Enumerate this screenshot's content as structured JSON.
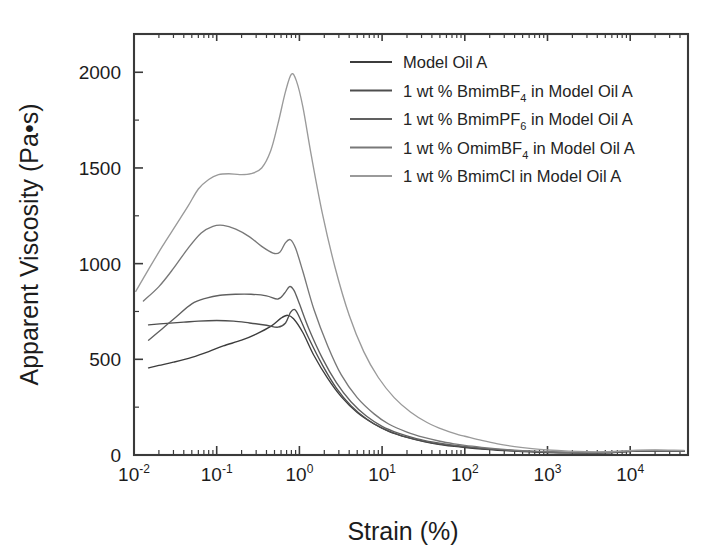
{
  "chart_data": {
    "type": "line",
    "title": "",
    "xlabel": "Strain (%)",
    "ylabel": "Apparent Viscosity (Pa•s)",
    "xscale": "log",
    "yscale": "linear",
    "xlim": [
      0.01,
      50000
    ],
    "ylim": [
      0,
      2200
    ],
    "grid": false,
    "legend_position": "top-right",
    "xticks": [
      {
        "value": 0.01,
        "mantissa": "10",
        "exponent": "-2",
        "label": "10-2"
      },
      {
        "value": 0.1,
        "mantissa": "10",
        "exponent": "-1",
        "label": "10-1"
      },
      {
        "value": 1,
        "mantissa": "10",
        "exponent": "0",
        "label": "100"
      },
      {
        "value": 10,
        "mantissa": "10",
        "exponent": "1",
        "label": "101"
      },
      {
        "value": 100,
        "mantissa": "10",
        "exponent": "2",
        "label": "102"
      },
      {
        "value": 1000,
        "mantissa": "10",
        "exponent": "3",
        "label": "103"
      },
      {
        "value": 10000,
        "mantissa": "10",
        "exponent": "4",
        "label": "104"
      }
    ],
    "yticks": [
      {
        "value": 0,
        "label": "0"
      },
      {
        "value": 500,
        "label": "500"
      },
      {
        "value": 1000,
        "label": "1000"
      },
      {
        "value": 1500,
        "label": "1500"
      },
      {
        "value": 2000,
        "label": "2000"
      }
    ],
    "yticks_minor": [
      250,
      750,
      1250,
      1750
    ],
    "series": [
      {
        "name": "Model Oil A",
        "label": "Model Oil A",
        "color": "#3c3c3c",
        "points": [
          [
            0.015,
            455
          ],
          [
            0.02,
            468
          ],
          [
            0.03,
            485
          ],
          [
            0.05,
            510
          ],
          [
            0.08,
            540
          ],
          [
            0.12,
            570
          ],
          [
            0.2,
            600
          ],
          [
            0.3,
            632
          ],
          [
            0.45,
            672
          ],
          [
            0.6,
            715
          ],
          [
            0.72,
            730
          ],
          [
            0.85,
            712
          ],
          [
            1.1,
            640
          ],
          [
            1.5,
            520
          ],
          [
            2.2,
            400
          ],
          [
            3.2,
            305
          ],
          [
            5,
            222
          ],
          [
            8,
            162
          ],
          [
            12,
            124
          ],
          [
            20,
            92
          ],
          [
            32,
            70
          ],
          [
            50,
            55
          ],
          [
            75,
            45
          ],
          [
            100,
            39
          ],
          [
            160,
            31
          ],
          [
            250,
            25
          ],
          [
            400,
            20
          ],
          [
            650,
            16
          ],
          [
            1000,
            13
          ],
          [
            1800,
            11
          ],
          [
            3000,
            10
          ],
          [
            5000,
            11
          ],
          [
            8000,
            16
          ],
          [
            12000,
            20
          ],
          [
            20000,
            21
          ],
          [
            32000,
            20
          ],
          [
            45000,
            19
          ]
        ]
      },
      {
        "name": "1 wt % BmimBF4 in Model Oil A",
        "label_parts": {
          "pre": "1 wt % BmimBF",
          "sub": "4",
          "post": " in Model Oil A"
        },
        "color": "#4e4e4e",
        "points": [
          [
            0.015,
            680
          ],
          [
            0.025,
            688
          ],
          [
            0.04,
            694
          ],
          [
            0.06,
            700
          ],
          [
            0.1,
            703
          ],
          [
            0.16,
            700
          ],
          [
            0.25,
            690
          ],
          [
            0.4,
            678
          ],
          [
            0.55,
            668
          ],
          [
            0.68,
            690
          ],
          [
            0.78,
            745
          ],
          [
            0.88,
            760
          ],
          [
            1.0,
            720
          ],
          [
            1.3,
            610
          ],
          [
            1.9,
            470
          ],
          [
            2.8,
            350
          ],
          [
            4.2,
            258
          ],
          [
            6.5,
            188
          ],
          [
            10,
            140
          ],
          [
            16,
            105
          ],
          [
            26,
            80
          ],
          [
            42,
            62
          ],
          [
            65,
            50
          ],
          [
            100,
            42
          ],
          [
            160,
            34
          ],
          [
            250,
            28
          ],
          [
            400,
            22
          ],
          [
            650,
            18
          ],
          [
            1000,
            15
          ],
          [
            1800,
            12
          ],
          [
            3000,
            11
          ],
          [
            5000,
            12
          ],
          [
            8000,
            17
          ],
          [
            12000,
            21
          ],
          [
            20000,
            22
          ],
          [
            32000,
            21
          ],
          [
            45000,
            20
          ]
        ]
      },
      {
        "name": "1 wt % BmimPF6 in Model Oil A",
        "label_parts": {
          "pre": "1 wt % BmimPF",
          "sub": "6",
          "post": " in Model Oil A"
        },
        "color": "#606060",
        "points": [
          [
            0.015,
            600
          ],
          [
            0.022,
            660
          ],
          [
            0.032,
            720
          ],
          [
            0.05,
            790
          ],
          [
            0.075,
            820
          ],
          [
            0.11,
            835
          ],
          [
            0.17,
            840
          ],
          [
            0.26,
            840
          ],
          [
            0.4,
            832
          ],
          [
            0.55,
            815
          ],
          [
            0.66,
            845
          ],
          [
            0.76,
            880
          ],
          [
            0.86,
            860
          ],
          [
            1.0,
            790
          ],
          [
            1.3,
            660
          ],
          [
            1.9,
            505
          ],
          [
            2.8,
            378
          ],
          [
            4.2,
            278
          ],
          [
            6.5,
            202
          ],
          [
            10,
            150
          ],
          [
            16,
            113
          ],
          [
            26,
            86
          ],
          [
            42,
            67
          ],
          [
            65,
            54
          ],
          [
            100,
            45
          ],
          [
            160,
            36
          ],
          [
            250,
            29
          ],
          [
            400,
            23
          ],
          [
            650,
            19
          ],
          [
            1000,
            16
          ],
          [
            1800,
            13
          ],
          [
            3000,
            12
          ],
          [
            5000,
            13
          ],
          [
            8000,
            18
          ],
          [
            12000,
            22
          ],
          [
            20000,
            23
          ],
          [
            32000,
            22
          ],
          [
            45000,
            21
          ]
        ]
      },
      {
        "name": "1 wt % OmimBF4 in Model Oil A",
        "label_parts": {
          "pre": "1 wt % OmimBF",
          "sub": "4",
          "post": " in Model Oil A"
        },
        "color": "#787878",
        "points": [
          [
            0.013,
            805
          ],
          [
            0.02,
            880
          ],
          [
            0.03,
            975
          ],
          [
            0.045,
            1080
          ],
          [
            0.065,
            1160
          ],
          [
            0.09,
            1195
          ],
          [
            0.12,
            1200
          ],
          [
            0.17,
            1180
          ],
          [
            0.25,
            1140
          ],
          [
            0.35,
            1090
          ],
          [
            0.48,
            1055
          ],
          [
            0.58,
            1060
          ],
          [
            0.68,
            1110
          ],
          [
            0.78,
            1125
          ],
          [
            0.9,
            1080
          ],
          [
            1.1,
            960
          ],
          [
            1.5,
            760
          ],
          [
            2.2,
            570
          ],
          [
            3.2,
            420
          ],
          [
            5,
            300
          ],
          [
            8,
            215
          ],
          [
            12,
            162
          ],
          [
            20,
            120
          ],
          [
            32,
            92
          ],
          [
            50,
            72
          ],
          [
            75,
            58
          ],
          [
            100,
            50
          ],
          [
            160,
            40
          ],
          [
            250,
            32
          ],
          [
            400,
            25
          ],
          [
            650,
            20
          ],
          [
            1000,
            17
          ],
          [
            1800,
            14
          ],
          [
            3000,
            13
          ],
          [
            5000,
            14
          ],
          [
            8000,
            19
          ],
          [
            12000,
            23
          ],
          [
            20000,
            24
          ],
          [
            32000,
            23
          ],
          [
            45000,
            22
          ]
        ]
      },
      {
        "name": "1 wt % BmimCl in Model Oil A",
        "label": "1 wt % BmimCl in Model Oil A",
        "color": "#9a9a9a",
        "points": [
          [
            0.0105,
            855
          ],
          [
            0.015,
            970
          ],
          [
            0.022,
            1090
          ],
          [
            0.032,
            1200
          ],
          [
            0.045,
            1300
          ],
          [
            0.06,
            1390
          ],
          [
            0.08,
            1440
          ],
          [
            0.105,
            1465
          ],
          [
            0.14,
            1470
          ],
          [
            0.19,
            1465
          ],
          [
            0.26,
            1470
          ],
          [
            0.35,
            1500
          ],
          [
            0.45,
            1590
          ],
          [
            0.55,
            1730
          ],
          [
            0.68,
            1900
          ],
          [
            0.8,
            1990
          ],
          [
            0.92,
            1955
          ],
          [
            1.1,
            1820
          ],
          [
            1.4,
            1560
          ],
          [
            1.9,
            1260
          ],
          [
            2.7,
            980
          ],
          [
            4,
            730
          ],
          [
            6,
            540
          ],
          [
            9,
            405
          ],
          [
            14,
            300
          ],
          [
            22,
            225
          ],
          [
            35,
            170
          ],
          [
            55,
            132
          ],
          [
            85,
            105
          ],
          [
            100,
            98
          ],
          [
            160,
            76
          ],
          [
            250,
            58
          ],
          [
            400,
            44
          ],
          [
            650,
            33
          ],
          [
            1000,
            26
          ],
          [
            1800,
            20
          ],
          [
            3000,
            17
          ],
          [
            5000,
            17
          ],
          [
            8000,
            21
          ],
          [
            12000,
            25
          ],
          [
            20000,
            26
          ],
          [
            32000,
            25
          ],
          [
            45000,
            24
          ]
        ]
      }
    ]
  },
  "legend": {
    "entries": [
      {
        "text": "Model Oil A"
      },
      {
        "text": "1 wt % BmimBF4 in Model Oil A"
      },
      {
        "text": "1 wt % BmimPF6 in Model Oil A"
      },
      {
        "text": "1 wt % OmimBF4 in Model Oil A"
      },
      {
        "text": "1 wt % BmimCl in Model Oil A"
      }
    ]
  }
}
